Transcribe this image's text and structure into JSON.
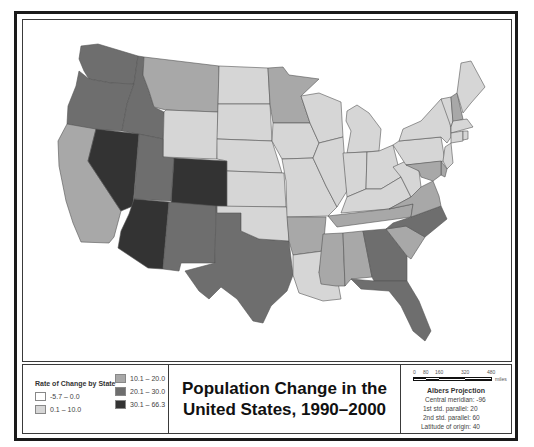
{
  "title": {
    "line1": "Population Change in the",
    "line2": "United States, 1990–2000"
  },
  "legend": {
    "title": "Rate of Change by State",
    "classes": [
      {
        "label": "-5.7 – 0.0",
        "color": "#ffffff"
      },
      {
        "label": "0.1 – 10.0",
        "color": "#d6d6d6"
      },
      {
        "label": "10.1 – 20.0",
        "color": "#a8a8a8"
      },
      {
        "label": "20.1 – 30.0",
        "color": "#6e6e6e"
      },
      {
        "label": "30.1 – 66.3",
        "color": "#333333"
      }
    ]
  },
  "scale_bar": {
    "ticks": [
      "0",
      "80",
      "160",
      "320",
      "480"
    ],
    "unit": "miles"
  },
  "projection": {
    "title": "Albers Projection",
    "lines": [
      "Central meridian: -96",
      "1st std. parallel: 20",
      "2nd std. parallel: 60",
      "Latitude of origin: 40"
    ]
  },
  "states": {
    "WA": {
      "class": 3
    },
    "OR": {
      "class": 3
    },
    "ID": {
      "class": 3
    },
    "MT": {
      "class": 2
    },
    "WY": {
      "class": 1
    },
    "CA": {
      "class": 2
    },
    "NV": {
      "class": 4
    },
    "UT": {
      "class": 3
    },
    "CO": {
      "class": 4
    },
    "AZ": {
      "class": 4
    },
    "NM": {
      "class": 3
    },
    "TX": {
      "class": 3
    },
    "ND": {
      "class": 1
    },
    "SD": {
      "class": 1
    },
    "NE": {
      "class": 1
    },
    "KS": {
      "class": 1
    },
    "OK": {
      "class": 1
    },
    "MN": {
      "class": 2
    },
    "IA": {
      "class": 1
    },
    "MO": {
      "class": 1
    },
    "AR": {
      "class": 2
    },
    "LA": {
      "class": 1
    },
    "WI": {
      "class": 1
    },
    "IL": {
      "class": 1
    },
    "MI": {
      "class": 1
    },
    "IN": {
      "class": 1
    },
    "OH": {
      "class": 1
    },
    "KY": {
      "class": 1
    },
    "TN": {
      "class": 2
    },
    "MS": {
      "class": 2
    },
    "AL": {
      "class": 2
    },
    "GA": {
      "class": 3
    },
    "FL": {
      "class": 3
    },
    "SC": {
      "class": 2
    },
    "NC": {
      "class": 3
    },
    "VA": {
      "class": 2
    },
    "WV": {
      "class": 1
    },
    "PA": {
      "class": 1
    },
    "NY": {
      "class": 1
    },
    "VT": {
      "class": 1
    },
    "NH": {
      "class": 2
    },
    "ME": {
      "class": 1
    },
    "MA": {
      "class": 1
    },
    "CT": {
      "class": 1
    },
    "RI": {
      "class": 1
    },
    "NJ": {
      "class": 1
    },
    "DE": {
      "class": 2
    },
    "MD": {
      "class": 2
    }
  }
}
